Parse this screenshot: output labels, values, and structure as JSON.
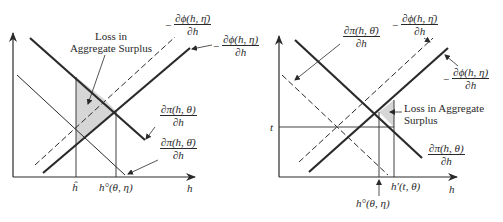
{
  "left_panel": {
    "annotation": {
      "line1": "Loss in",
      "line2": "Aggregate Surplus"
    },
    "curves": {
      "phi_eta_bar": {
        "neg": "−",
        "num": "∂ϕ(h, η̄)",
        "den": "∂h"
      },
      "phi_eta": {
        "neg": "−",
        "num": "∂ϕ(h, η)",
        "den": "∂h"
      },
      "pi_theta": {
        "num": "∂π(h, θ)",
        "den": "∂h"
      },
      "pi_theta_bar": {
        "num": "∂π(h, θ̄)",
        "den": "∂h"
      }
    },
    "x_ticks": {
      "h_hat": "ĥ",
      "h_opt": "h°(θ, η)"
    },
    "x_axis_label": "h"
  },
  "right_panel": {
    "annotation": {
      "line1": "Loss in Aggregate",
      "line2": "Surplus"
    },
    "curves": {
      "pi_theta_bar": {
        "num": "∂π(h, θ̄)",
        "den": "∂h"
      },
      "phi_eta_bar": {
        "neg": "−",
        "num": "∂ϕ(h, η̄)",
        "den": "∂h"
      },
      "phi_eta": {
        "neg": "−",
        "num": "∂ϕ(h, η)",
        "den": "∂h"
      },
      "pi_theta": {
        "num": "∂π(h, θ)",
        "den": "∂h"
      }
    },
    "y_tick": "t",
    "x_ticks": {
      "h_prime": "h′(t, θ)",
      "h_opt": "h°(θ, η)"
    },
    "x_axis_label": "h"
  },
  "colors": {
    "line": "#2a2a2a",
    "shade": "#d6d6d6",
    "background": "#ffffff"
  }
}
